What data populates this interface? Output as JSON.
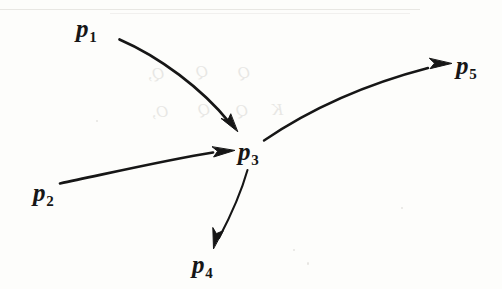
{
  "figure": {
    "kind": "directed-graph",
    "caption": "",
    "ink_color": "#161616",
    "paper_color": "#fdfdfb",
    "width": 502,
    "height": 289,
    "nodes": [
      {
        "id": "p1",
        "base": "p",
        "subscript": "1",
        "label": "p1",
        "x": 76,
        "y": 16
      },
      {
        "id": "p2",
        "base": "p",
        "subscript": "2",
        "label": "p2",
        "x": 33,
        "y": 180
      },
      {
        "id": "p3",
        "base": "p",
        "subscript": "3",
        "label": "p3",
        "x": 238,
        "y": 139
      },
      {
        "id": "p4",
        "base": "p",
        "subscript": "4",
        "label": "p4",
        "x": 192,
        "y": 252
      },
      {
        "id": "p5",
        "base": "p",
        "subscript": "5",
        "label": "p5",
        "x": 456,
        "y": 53
      }
    ],
    "edges": [
      {
        "id": "e1",
        "from": "p1",
        "to": "p3",
        "direction": "p1 -> p3",
        "curve": "concave-up"
      },
      {
        "id": "e2",
        "from": "p2",
        "to": "p3",
        "direction": "p2 -> p3",
        "curve": "concave-down"
      },
      {
        "id": "e3",
        "from": "p3",
        "to": "p4",
        "direction": "p3 -> p4",
        "curve": "near-straight"
      },
      {
        "id": "e4",
        "from": "p3",
        "to": "p5",
        "direction": "p3 -> p5",
        "curve": "concave-down"
      }
    ],
    "bleed_through": [
      {
        "text": "Q,",
        "x": 148,
        "y": 64,
        "size": 17
      },
      {
        "text": "Q",
        "x": 196,
        "y": 62,
        "size": 17
      },
      {
        "text": "Q",
        "x": 238,
        "y": 63,
        "size": 17
      },
      {
        "text": "O,",
        "x": 152,
        "y": 102,
        "size": 17
      },
      {
        "text": "Q",
        "x": 198,
        "y": 100,
        "size": 17
      },
      {
        "text": "Q",
        "x": 236,
        "y": 101,
        "size": 17
      },
      {
        "text": "K",
        "x": 272,
        "y": 100,
        "size": 17
      }
    ]
  }
}
